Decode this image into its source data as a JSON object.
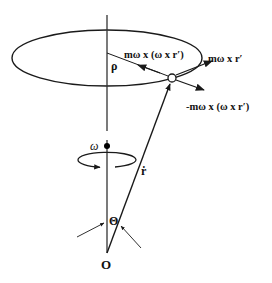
{
  "diagram": {
    "type": "rotating-frame-forces",
    "colors": {
      "stroke": "#1a1a1a",
      "background": "#ffffff"
    },
    "labels": {
      "centripetal": "mω x (ω x r′)",
      "tangential": "mω x r′",
      "centrifugal": "-mω x (ω x r′)",
      "radius": "ρ",
      "angular_velocity": "ω",
      "position_vector": "ṙ",
      "angle": "Θ",
      "origin": "O"
    },
    "elements": [
      {
        "name": "orbit-ellipse",
        "shape": "ellipse",
        "cx": 107,
        "cy": 58,
        "rx": 95,
        "ry": 28
      },
      {
        "name": "rotation-axis",
        "shape": "line",
        "from": [
          107,
          15
        ],
        "to": [
          107,
          253
        ]
      },
      {
        "name": "particle",
        "shape": "circle",
        "cx": 172,
        "cy": 78,
        "r": 4
      },
      {
        "name": "radius-line",
        "shape": "line",
        "from": [
          107,
          53
        ],
        "to": [
          168,
          76
        ]
      },
      {
        "name": "position-vector",
        "shape": "arrow",
        "from": [
          107,
          253
        ],
        "to": [
          171,
          83
        ]
      },
      {
        "name": "omega-dot",
        "shape": "dot",
        "cx": 107,
        "cy": 146
      },
      {
        "name": "rotation-arrow",
        "shape": "arc-arrow",
        "cx": 107,
        "cy": 160
      }
    ]
  }
}
